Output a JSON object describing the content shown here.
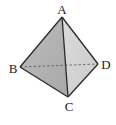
{
  "figure": {
    "type": "tetrahedron",
    "vertices": {
      "A": {
        "label": "A"
      },
      "B": {
        "label": "B"
      },
      "C": {
        "label": "C"
      },
      "D": {
        "label": "D"
      }
    },
    "visible_faces": [
      {
        "name": "ABC",
        "color": "#b3b3b3"
      },
      {
        "name": "ACD",
        "color": "#d4d4d4"
      }
    ],
    "visible_edges": [
      "AB",
      "AC",
      "AD",
      "BC",
      "CD"
    ],
    "hidden_edges": [
      "BD"
    ],
    "colors": {
      "edge": "#2a2a2a",
      "hidden_edge": "#555555",
      "label": "#222222"
    }
  }
}
